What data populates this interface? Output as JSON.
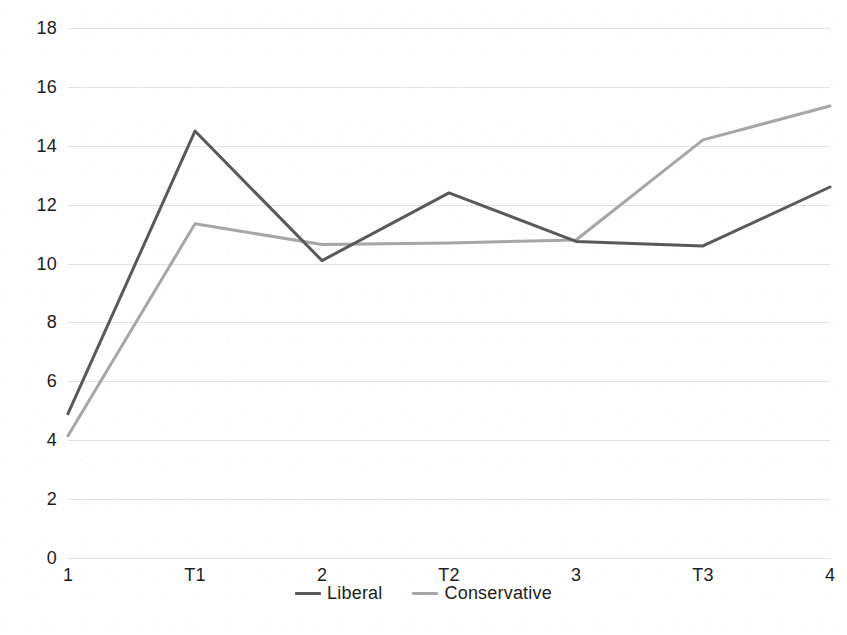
{
  "chart_data": {
    "type": "line",
    "title": "",
    "subtitle": "",
    "xlabel": "",
    "ylabel": "",
    "categories": [
      "1",
      "T1",
      "2",
      "T2",
      "3",
      "T3",
      "4"
    ],
    "series": [
      {
        "name": "Liberal",
        "color": "#595959",
        "values": [
          4.9,
          14.5,
          10.1,
          12.4,
          10.75,
          10.6,
          12.6
        ]
      },
      {
        "name": "Conservative",
        "color": "#a6a6a6",
        "values": [
          4.15,
          11.35,
          10.65,
          10.7,
          10.8,
          14.2,
          15.35
        ]
      }
    ],
    "ylim": [
      0,
      18
    ],
    "ytick_step": 2,
    "ytick_labels": [
      "0",
      "2",
      "4",
      "6",
      "8",
      "10",
      "12",
      "14",
      "16",
      "18"
    ],
    "xtick_labels": [
      "1",
      "T1",
      "2",
      "T2",
      "3",
      "T3",
      "4"
    ],
    "grid": true,
    "grid_axis": "y",
    "grid_color": "#e3e3e3",
    "legend_position": "bottom",
    "legend_entries": [
      {
        "label": "Liberal",
        "color": "#595959"
      },
      {
        "label": "Conservative",
        "color": "#a6a6a6"
      }
    ],
    "markers": false,
    "line_width": 3,
    "background": "#ffffff"
  }
}
